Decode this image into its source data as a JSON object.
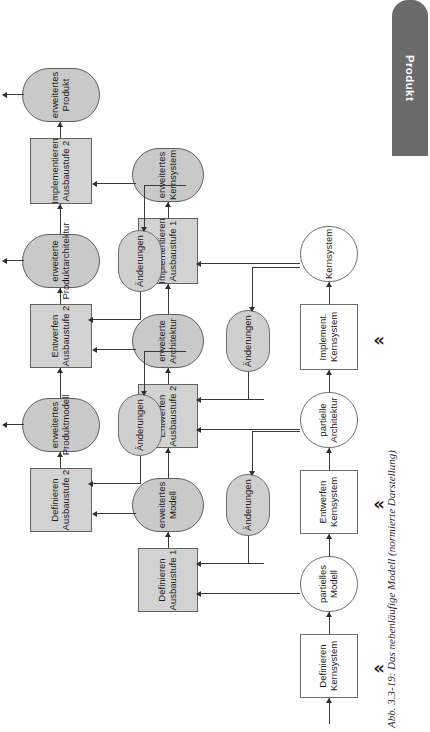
{
  "figure": {
    "caption": "Abb. 3.3-19: Das nebenläufige Modell (normierte Darstellung)",
    "product_tab_label": "Produkt",
    "continuation_marker": "⋯",
    "milestone_marker": "«"
  },
  "rows": [
    {
      "id": "kernsystem",
      "name": "Kernsystem-Zyklus",
      "nodes": [
        {
          "kind": "activity",
          "shaded": false,
          "label": "Definieren\nKernsystem"
        },
        {
          "kind": "artifact",
          "shaded": false,
          "label": "partielles\nModell"
        },
        {
          "kind": "activity",
          "shaded": false,
          "label": "Entwerfen\nKernsystem"
        },
        {
          "kind": "artifact",
          "shaded": false,
          "label": "partielle\nArchitektur"
        },
        {
          "kind": "activity",
          "shaded": false,
          "label": "Implement.\nKernsystem"
        },
        {
          "kind": "artifact",
          "shaded": false,
          "label": "Kernsystem"
        }
      ]
    },
    {
      "id": "ausbaustufe1",
      "name": "Ausbaustufe-1-Zyklus",
      "nodes": [
        {
          "kind": "activity",
          "shaded": true,
          "label": "Definieren\nAusbaustufe 1"
        },
        {
          "kind": "artifact",
          "shaded": true,
          "label": "erweitertes\nModell"
        },
        {
          "kind": "activity",
          "shaded": true,
          "label": "Entwerfen\nAusbaustufe 2"
        },
        {
          "kind": "artifact",
          "shaded": true,
          "label": "erweiterte\nArchitektur"
        },
        {
          "kind": "activity",
          "shaded": true,
          "label": "Implementieren\nAusbaustufe 1"
        },
        {
          "kind": "artifact",
          "shaded": true,
          "label": "erweitertes\nKernsystem"
        }
      ],
      "changes": [
        {
          "label": "Änderungen"
        },
        {
          "label": "Änderungen"
        }
      ]
    },
    {
      "id": "ausbaustufe2",
      "name": "Ausbaustufe-2-Zyklus",
      "nodes": [
        {
          "kind": "activity",
          "shaded": true,
          "label": "Definieren\nAusbaustufe 2"
        },
        {
          "kind": "artifact",
          "shaded": true,
          "label": "erweitertes\nProduktmodell"
        },
        {
          "kind": "activity",
          "shaded": true,
          "label": "Entwerfen\nAusbaustufe 2"
        },
        {
          "kind": "artifact",
          "shaded": true,
          "label": "erweiterte\nProduktarchitektur"
        },
        {
          "kind": "activity",
          "shaded": true,
          "label": "Implementieren\nAusbaustufe 2"
        },
        {
          "kind": "artifact",
          "shaded": true,
          "label": "erweitertes\nProdukt"
        }
      ],
      "changes": [
        {
          "label": "Änderungen"
        },
        {
          "label": "Änderungen"
        }
      ]
    }
  ],
  "colors": {
    "shaded_fill": "#cfcfcf",
    "plain_fill": "#ffffff",
    "stroke": "#6d6d6d",
    "arrow": "#2e2e2e",
    "tab_fill": "#6b6b6b",
    "tab_text": "#ffffff"
  }
}
